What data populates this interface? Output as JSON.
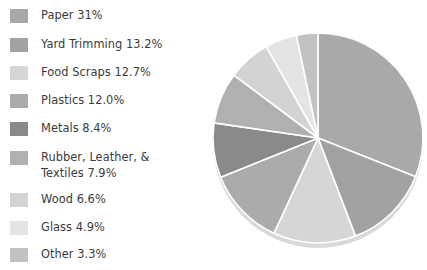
{
  "chart_data": {
    "type": "pie",
    "title": "",
    "subtitle": "",
    "xlabel": "",
    "ylabel": "",
    "legend_position": "left",
    "grid": false,
    "units": "percent",
    "start_angle_deg": 0,
    "direction": "clockwise",
    "categories": [
      "Paper",
      "Yard Trimming",
      "Food Scraps",
      "Plastics",
      "Metals",
      "Rubber, Leather, & Textiles",
      "Wood",
      "Glass",
      "Other"
    ],
    "values": [
      31.0,
      13.2,
      12.7,
      12.0,
      8.4,
      7.9,
      6.6,
      4.9,
      3.3
    ],
    "value_labels": [
      "31%",
      "13.2%",
      "12.7%",
      "12.0%",
      "8.4%",
      "7.9%",
      "6.6%",
      "4.9%",
      "3.3%"
    ],
    "colors": [
      "#a9a9a9",
      "#a2a2a2",
      "#d6d6d6",
      "#ababab",
      "#8a8a8a",
      "#b0b0b0",
      "#d3d3d3",
      "#e4e4e4",
      "#c2c2c2"
    ],
    "slice_separator_color": "#ffffff",
    "rim_color": "#d9d9d9"
  },
  "legend": {
    "items": [
      {
        "label": "Paper 31%",
        "color": "#a9a9a9",
        "swatch_name": "legend-swatch-paper"
      },
      {
        "label": "Yard Trimming 13.2%",
        "color": "#a2a2a2",
        "swatch_name": "legend-swatch-yard-trimming"
      },
      {
        "label": "Food Scraps 12.7%",
        "color": "#d6d6d6",
        "swatch_name": "legend-swatch-food-scraps"
      },
      {
        "label": "Plastics 12.0%",
        "color": "#ababab",
        "swatch_name": "legend-swatch-plastics"
      },
      {
        "label": "Metals 8.4%",
        "color": "#8a8a8a",
        "swatch_name": "legend-swatch-metals"
      },
      {
        "label": "Rubber, Leather, &\nTextiles 7.9%",
        "color": "#b0b0b0",
        "swatch_name": "legend-swatch-rubber-leather-textiles"
      },
      {
        "label": "Wood 6.6%",
        "color": "#d3d3d3",
        "swatch_name": "legend-swatch-wood"
      },
      {
        "label": "Glass 4.9%",
        "color": "#e4e4e4",
        "swatch_name": "legend-swatch-glass"
      },
      {
        "label": "Other 3.3%",
        "color": "#c2c2c2",
        "swatch_name": "legend-swatch-other"
      }
    ]
  },
  "pie": {
    "center_x": 113,
    "center_y": 113,
    "radius": 105,
    "rim_offset_y": 5
  }
}
